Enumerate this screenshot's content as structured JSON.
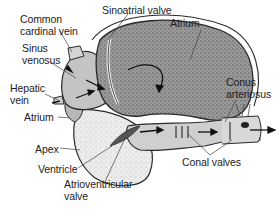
{
  "diagram": {
    "labels": {
      "common_cardinal_vein_1": "Common",
      "common_cardinal_vein_2": "cardinal vein",
      "sinoatrial_valve": "Sinoatrial valve",
      "atrium_top": "Atrium",
      "sinus_venosus_1": "Sinus",
      "sinus_venosus_2": "venosus",
      "hepatic_vein_1": "Hepatic",
      "hepatic_vein_2": "vein",
      "atrium_left": "Atrium",
      "conus_arteriosus_1": "Conus",
      "conus_arteriosus_2": "arteriosus",
      "apex": "Apex",
      "ventricle": "Ventricle",
      "atrioventricular_valve_1": "Atrioventricular",
      "atrioventricular_valve_2": "valve",
      "conal_valves": "Conal valves"
    },
    "colors": {
      "outline": "#2a2a2a",
      "atrium_fill": "#8a8a8a",
      "ventricle_fill": "#e4e4e4",
      "sinus_fill": "#bdbdbd",
      "conus_fill": "#cfcfcf",
      "leader": "#444444"
    }
  }
}
